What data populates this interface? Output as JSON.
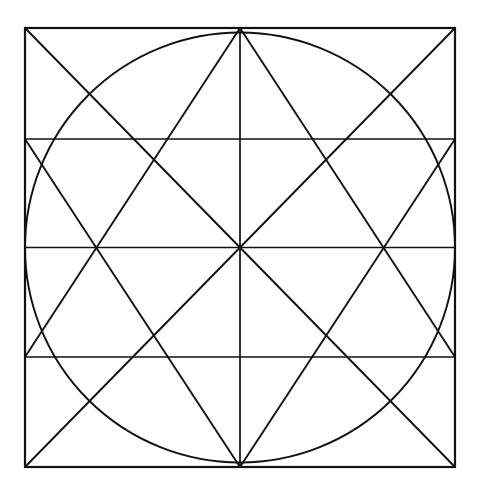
{
  "figure": {
    "background_color": "#ffffff",
    "stroke_color": "#111111",
    "canvas": {
      "width": 480,
      "height": 495
    }
  },
  "geometry": {
    "square": {
      "name": "outer-square",
      "left": 25,
      "top": 28,
      "right": 455,
      "bottom": 467,
      "width": 430,
      "height": 439,
      "stroke_width": 2.2
    },
    "circle": {
      "name": "inscribed-circle",
      "cx": 240,
      "cy": 247.5,
      "r": 215,
      "stroke_width": 1.9
    },
    "center_point": {
      "x": 240,
      "y": 247.5
    },
    "horizontal_lines": [
      {
        "name": "upper-horizontal",
        "y": 139,
        "x1": 25,
        "x2": 455,
        "stroke_width": 1.5
      },
      {
        "name": "middle-horizontal",
        "y": 247.5,
        "x1": 25,
        "x2": 455,
        "stroke_width": 1.7
      },
      {
        "name": "lower-horizontal",
        "y": 357,
        "x1": 25,
        "x2": 455,
        "stroke_width": 1.5
      }
    ],
    "vertical_lines": [
      {
        "name": "center-vertical",
        "x": 240,
        "y1": 28,
        "y2": 467,
        "stroke_width": 1.7
      }
    ],
    "diagonals": [
      {
        "name": "diagonal-tl-br",
        "x1": 25,
        "y1": 28,
        "x2": 455,
        "y2": 467,
        "stroke_width": 1.9
      },
      {
        "name": "diagonal-tr-bl",
        "x1": 455,
        "y1": 28,
        "x2": 25,
        "y2": 467,
        "stroke_width": 1.9
      },
      {
        "name": "diagonal-topcenter-to-left",
        "x1": 240,
        "y1": 28,
        "x2": 25,
        "y2": 357,
        "stroke_width": 1.9
      },
      {
        "name": "diagonal-topcenter-to-right",
        "x1": 240,
        "y1": 28,
        "x2": 455,
        "y2": 357,
        "stroke_width": 1.9
      },
      {
        "name": "diagonal-bottomcenter-to-left",
        "x1": 240,
        "y1": 467,
        "x2": 25,
        "y2": 139,
        "stroke_width": 1.9
      },
      {
        "name": "diagonal-bottomcenter-to-right",
        "x1": 240,
        "y1": 467,
        "x2": 455,
        "y2": 139,
        "stroke_width": 1.9
      }
    ],
    "vertices": [
      {
        "name": "vertex-top-left",
        "x": 25,
        "y": 28
      },
      {
        "name": "vertex-top-center",
        "x": 240,
        "y": 28
      },
      {
        "name": "vertex-top-right",
        "x": 455,
        "y": 28
      },
      {
        "name": "vertex-left-upper",
        "x": 25,
        "y": 139
      },
      {
        "name": "vertex-right-upper",
        "x": 455,
        "y": 139
      },
      {
        "name": "vertex-left-middle",
        "x": 25,
        "y": 247.5
      },
      {
        "name": "vertex-right-middle",
        "x": 455,
        "y": 247.5
      },
      {
        "name": "vertex-left-lower",
        "x": 25,
        "y": 357
      },
      {
        "name": "vertex-right-lower",
        "x": 455,
        "y": 357
      },
      {
        "name": "vertex-bottom-left",
        "x": 25,
        "y": 467
      },
      {
        "name": "vertex-bottom-center",
        "x": 240,
        "y": 467
      },
      {
        "name": "vertex-bottom-right",
        "x": 455,
        "y": 467
      }
    ],
    "intersection_nodes": [
      {
        "name": "node-left-middle-cross",
        "x": 95,
        "y": 247.5
      },
      {
        "name": "node-right-middle-cross",
        "x": 385,
        "y": 247.5
      }
    ]
  },
  "labels": {
    "has_text_labels": false,
    "annotations": []
  }
}
